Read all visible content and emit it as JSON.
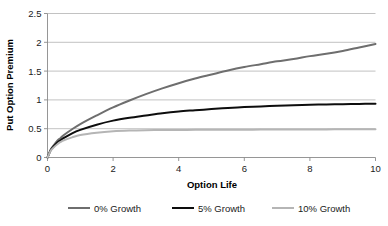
{
  "chart_data": {
    "type": "line",
    "title": "",
    "xlabel": "Option Life",
    "ylabel": "Put Option Premium",
    "xlim": [
      0,
      10
    ],
    "ylim": [
      0,
      2.5
    ],
    "xticks": [
      "0",
      "2",
      "4",
      "6",
      "8",
      "10"
    ],
    "xtick_values": [
      0,
      2,
      4,
      6,
      8,
      10
    ],
    "yticks": [
      "0",
      "0.5",
      "1",
      "1.5",
      "2",
      "2.5"
    ],
    "ytick_values": [
      0,
      0.5,
      1,
      1.5,
      2,
      2.5
    ],
    "grid": "horizontal",
    "legend_position": "bottom",
    "x": [
      0,
      0.1,
      0.2,
      0.3,
      0.4,
      0.5,
      0.75,
      1,
      1.5,
      2,
      2.5,
      3,
      3.5,
      4,
      4.5,
      5,
      5.5,
      6,
      6.5,
      7,
      7.5,
      8,
      8.5,
      9,
      9.5,
      10
    ],
    "series": [
      {
        "name": "0% Growth",
        "color": "#6e6e6e",
        "width": 2.0,
        "values": [
          0,
          0.14,
          0.22,
          0.29,
          0.34,
          0.39,
          0.49,
          0.58,
          0.73,
          0.87,
          0.99,
          1.1,
          1.2,
          1.29,
          1.37,
          1.44,
          1.51,
          1.57,
          1.62,
          1.67,
          1.71,
          1.76,
          1.8,
          1.85,
          1.91,
          1.97
        ]
      },
      {
        "name": "5% Growth",
        "color": "#0d0d0d",
        "width": 2.0,
        "values": [
          0,
          0.13,
          0.2,
          0.26,
          0.3,
          0.34,
          0.42,
          0.48,
          0.57,
          0.64,
          0.69,
          0.73,
          0.77,
          0.8,
          0.82,
          0.84,
          0.86,
          0.875,
          0.887,
          0.898,
          0.907,
          0.915,
          0.921,
          0.926,
          0.93,
          0.933
        ]
      },
      {
        "name": "10% Growth",
        "color": "#b5b5b5",
        "width": 2.0,
        "values": [
          0,
          0.12,
          0.18,
          0.23,
          0.27,
          0.3,
          0.35,
          0.39,
          0.43,
          0.455,
          0.468,
          0.474,
          0.477,
          0.479,
          0.48,
          0.481,
          0.482,
          0.483,
          0.484,
          0.485,
          0.486,
          0.487,
          0.488,
          0.489,
          0.49,
          0.49
        ]
      }
    ]
  },
  "style": {
    "grid_color": "#b3b3b3",
    "axis_color": "#8a8a8a",
    "text_color": "#1a1a1a",
    "background": "#ffffff"
  },
  "legend": {
    "items": [
      {
        "label": "0% Growth",
        "color": "#6e6e6e"
      },
      {
        "label": "5% Growth",
        "color": "#0d0d0d"
      },
      {
        "label": "10% Growth",
        "color": "#b5b5b5"
      }
    ]
  }
}
